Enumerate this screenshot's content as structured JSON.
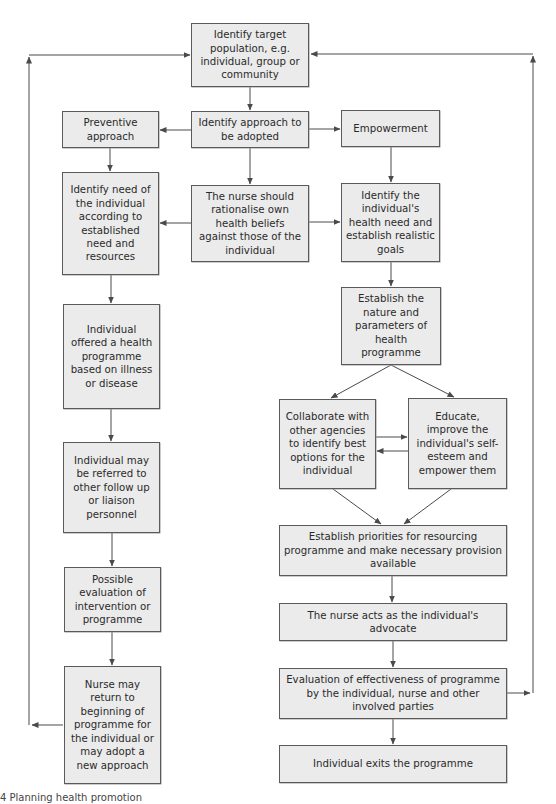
{
  "colors": {
    "box_fill": "#ebebeb",
    "box_border": "#5a5a5a",
    "line": "#4a4a4a",
    "text": "#2a2a2a"
  },
  "nodes": {
    "target_population": "Identify target population, e.g. individual, group or community",
    "identify_approach": "Identify approach to be adopted",
    "preventive": "Preventive approach",
    "empowerment": "Empowerment",
    "identify_need": "Identify need of the individual according to established need and resources",
    "nurse_rationalise": "The nurse should rationalise own health beliefs against those of the individual",
    "identify_health_need": "Identify the individual's health need and establish realistic goals",
    "offered_programme": "Individual offered a health programme based on illness or disease",
    "establish_nature": "Establish the nature and parameters of health programme",
    "referred": "Individual may be referred to other follow up or liaison personnel",
    "collaborate": "Collaborate with other agencies to identify best options for the individual",
    "educate": "Educate, improve the individual's self-esteem and empower them",
    "priorities": "Establish priorities for resourcing programme and make necessary provision available",
    "possible_evaluation": "Possible evaluation of intervention or programme",
    "advocate": "The nurse acts as the individual's advocate",
    "nurse_return": "Nurse may return to beginning of programme for the individual or may adopt a new approach",
    "evaluation_effectiveness": "Evaluation of effectiveness of programme by the individual, nurse and other involved parties",
    "exits": "Individual exits the programme"
  },
  "edges": [
    [
      "target_population",
      "identify_approach"
    ],
    [
      "identify_approach",
      "preventive"
    ],
    [
      "identify_approach",
      "empowerment"
    ],
    [
      "identify_approach",
      "nurse_rationalise"
    ],
    [
      "preventive",
      "identify_need"
    ],
    [
      "empowerment",
      "identify_health_need"
    ],
    [
      "nurse_rationalise",
      "identify_need"
    ],
    [
      "nurse_rationalise",
      "identify_health_need"
    ],
    [
      "identify_need",
      "offered_programme"
    ],
    [
      "identify_health_need",
      "establish_nature"
    ],
    [
      "offered_programme",
      "referred"
    ],
    [
      "establish_nature",
      "collaborate"
    ],
    [
      "establish_nature",
      "educate"
    ],
    [
      "collaborate",
      "educate"
    ],
    [
      "educate",
      "collaborate"
    ],
    [
      "collaborate",
      "priorities"
    ],
    [
      "educate",
      "priorities"
    ],
    [
      "referred",
      "possible_evaluation"
    ],
    [
      "priorities",
      "advocate"
    ],
    [
      "possible_evaluation",
      "nurse_return"
    ],
    [
      "advocate",
      "evaluation_effectiveness"
    ],
    [
      "evaluation_effectiveness",
      "exits"
    ],
    [
      "nurse_return",
      "target_population"
    ],
    [
      "evaluation_effectiveness",
      "target_population"
    ]
  ],
  "caption": "4  Planning health promotion"
}
